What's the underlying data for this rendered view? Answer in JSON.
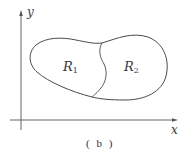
{
  "figure": {
    "caption": "( b )",
    "axes": {
      "x_label": "x",
      "y_label": "y"
    },
    "regions": [
      {
        "name": "R",
        "subscript": "1"
      },
      {
        "name": "R",
        "subscript": "2"
      }
    ],
    "colors": {
      "stroke": "#4a4a4a",
      "axis": "#555555",
      "background": "#ffffff"
    }
  }
}
